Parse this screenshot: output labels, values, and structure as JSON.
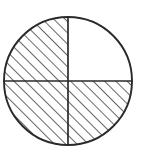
{
  "figure": {
    "kind": "fraction-circle-diagram",
    "title": "Circle divided into four quarters with three quarters shaded",
    "shaded_fraction": "3/4",
    "shaded_count": 3,
    "total_parts": 4,
    "background_color": "#ffffff",
    "stroke_color": "#2a2a2a",
    "hatch_color": "#333333",
    "unshaded_fill_color": "#ffffff"
  },
  "circle": {
    "center_x": 68,
    "center_y": 81,
    "radius": 64,
    "outline_width": 1.9
  },
  "dividers": [
    {
      "name": "vertical-diameter",
      "orientation": "vertical",
      "x1": 68,
      "y1": 17,
      "x2": 68,
      "y2": 145,
      "width": 1.7
    },
    {
      "name": "horizontal-diameter",
      "orientation": "horizontal",
      "x1": 4,
      "y1": 81,
      "x2": 132,
      "y2": 81,
      "width": 1.7
    }
  ],
  "hatch": {
    "angle_degrees": 45,
    "direction": "lower-left-to-upper-right",
    "spacing_px": 8,
    "line_width": 1.5,
    "color": "#333333"
  },
  "quadrants": [
    {
      "name": "top-left",
      "label": "Quadrant 1",
      "shaded": true,
      "fill": "hatched"
    },
    {
      "name": "top-right",
      "label": "Quadrant 2",
      "shaded": true,
      "fill": "hatched"
    },
    {
      "name": "bottom-left",
      "label": "Quadrant 3",
      "shaded": true,
      "fill": "hatched"
    },
    {
      "name": "bottom-right",
      "label": "Quadrant 4",
      "shaded": false,
      "fill": "white"
    }
  ]
}
